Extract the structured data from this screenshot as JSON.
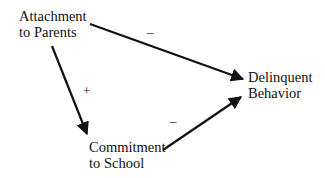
{
  "diagram": {
    "nodes": {
      "attachment": {
        "line1": "Attachment",
        "line2": "to Parents"
      },
      "delinquent": {
        "line1": "Delinquent",
        "line2": "Behavior"
      },
      "commitment": {
        "line1": "Commitment",
        "line2": "to School"
      }
    },
    "edges": [
      {
        "from": "Attachment to Parents",
        "to": "Delinquent Behavior",
        "sign": "–"
      },
      {
        "from": "Attachment to Parents",
        "to": "Commitment to School",
        "sign": "+"
      },
      {
        "from": "Commitment to School",
        "to": "Delinquent Behavior",
        "sign": "–"
      }
    ],
    "colors": {
      "line": "#111111",
      "background": "#ffffff"
    }
  }
}
